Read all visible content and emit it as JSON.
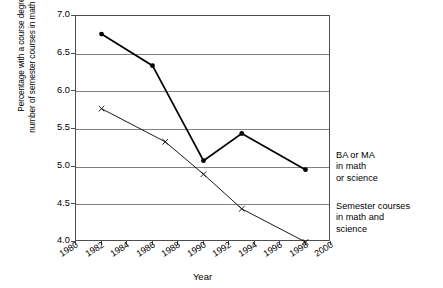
{
  "chart_data": {
    "type": "line",
    "title": "",
    "xlabel": "Year",
    "ylabel": "Percentage with a course degree and number of semester courses in math and science",
    "ylabel_line1": "Percentage with a course degree ",
    "ylabel_line1_italic": "and",
    "ylabel_line2": "number of semester courses in math and science",
    "xlim": [
      1980,
      2000
    ],
    "ylim": [
      4.0,
      7.0
    ],
    "grid": true,
    "legend_position": "right",
    "x_ticks": [
      "1980",
      "1982",
      "1984",
      "1986",
      "1988",
      "1990",
      "1992",
      "1994",
      "1996",
      "1998",
      "2000"
    ],
    "x_tick_values": [
      1980,
      1982,
      1984,
      1986,
      1988,
      1990,
      1992,
      1994,
      1996,
      1998,
      2000
    ],
    "y_ticks": [
      "4.0",
      "4.5",
      "5.0",
      "5.5",
      "6.0",
      "6.5",
      "7.0"
    ],
    "y_tick_values": [
      4.0,
      4.5,
      5.0,
      5.5,
      6.0,
      6.5,
      7.0
    ],
    "series": [
      {
        "name": "BA or MA in math or science",
        "marker": "filled-diamond",
        "color": "#000000",
        "x": [
          1982,
          1986,
          1990,
          1993,
          1998
        ],
        "values": [
          6.76,
          6.34,
          5.08,
          5.44,
          4.96
        ]
      },
      {
        "name": "Semester courses in math and science",
        "marker": "x",
        "color": "#000000",
        "x": [
          1982,
          1987,
          1990,
          1993,
          1998
        ],
        "values": [
          5.77,
          5.33,
          4.9,
          4.44,
          4.0
        ]
      }
    ]
  },
  "legend": {
    "ba": {
      "line1": "BA or MA",
      "line2": "in math",
      "line3": "or science"
    },
    "semester": {
      "line1": "Semester courses",
      "line2": "in math and",
      "line3": "science"
    }
  }
}
